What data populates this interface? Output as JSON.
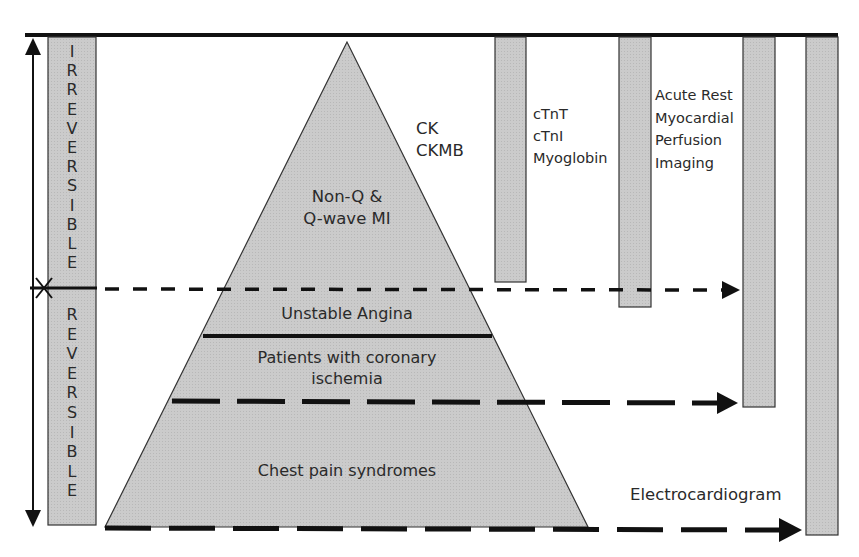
{
  "diagram": {
    "type": "pyramid-diagnostic-sensitivity",
    "colors": {
      "fill": "#c8c8c8",
      "stroke": "#1a1a1a",
      "background": "#ffffff"
    },
    "left_axis": {
      "upper_label": "IRREVERSIBLE",
      "lower_label": "REVERSIBLE",
      "divider_marker": "X"
    },
    "pyramid_layers": [
      {
        "id": "mi",
        "label_line1": "Non-Q &",
        "label_line2": "Q-wave MI"
      },
      {
        "id": "unstable-angina",
        "label": "Unstable Angina"
      },
      {
        "id": "ischemia",
        "label_line1": "Patients with coronary",
        "label_line2": "ischemia"
      },
      {
        "id": "chest-pain",
        "label": "Chest pain syndromes"
      }
    ],
    "tests": [
      {
        "id": "ck",
        "line1": "CK",
        "line2": "CKMB"
      },
      {
        "id": "troponin",
        "line1": "cTnT",
        "line2": "cTnI",
        "line3": "Myoglobin"
      },
      {
        "id": "mpi",
        "line1": "Acute Rest",
        "line2": "Myocardial",
        "line3": "Perfusion",
        "line4": "Imaging"
      },
      {
        "id": "ecg",
        "label": "Electrocardiogram"
      }
    ]
  }
}
